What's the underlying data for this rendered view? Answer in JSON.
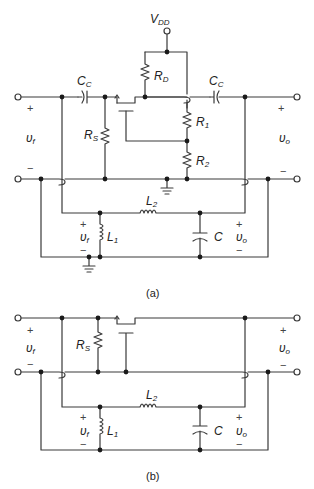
{
  "figure": {
    "panels": [
      {
        "id": "a",
        "caption": "(a)",
        "labels": {
          "vdd": {
            "main": "V",
            "sub": "DD"
          },
          "cc_left": {
            "main": "C",
            "sub": "C"
          },
          "cc_right": {
            "main": "C",
            "sub": "C"
          },
          "rd": {
            "main": "R",
            "sub": "D"
          },
          "rs": {
            "main": "R",
            "sub": "S"
          },
          "r1": {
            "main": "R",
            "sub": "1"
          },
          "r2": {
            "main": "R",
            "sub": "2"
          },
          "l1": {
            "main": "L",
            "sub": "1"
          },
          "l2": {
            "main": "L",
            "sub": "2"
          },
          "c": {
            "main": "C",
            "sub": ""
          },
          "vf_in": {
            "main": "υ",
            "sub": "f"
          },
          "vo_out": {
            "main": "υ",
            "sub": "o"
          },
          "vf_filter": {
            "main": "υ",
            "sub": "f"
          },
          "vo_filter": {
            "main": "υ",
            "sub": "o"
          }
        }
      },
      {
        "id": "b",
        "caption": "(b)",
        "labels": {
          "rs": {
            "main": "R",
            "sub": "S"
          },
          "l1": {
            "main": "L",
            "sub": "1"
          },
          "l2": {
            "main": "L",
            "sub": "2"
          },
          "c": {
            "main": "C",
            "sub": ""
          },
          "vf_in": {
            "main": "υ",
            "sub": "f"
          },
          "vo_out": {
            "main": "υ",
            "sub": "o"
          },
          "vf_filter": {
            "main": "υ",
            "sub": "f"
          },
          "vo_filter": {
            "main": "υ",
            "sub": "o"
          }
        }
      }
    ],
    "signs": {
      "plus": "+",
      "minus": "−"
    }
  }
}
